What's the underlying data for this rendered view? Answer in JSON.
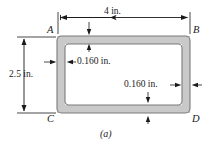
{
  "figure": {
    "caption": "(a)",
    "colors": {
      "wall_fill": "#c9c9c9",
      "wall_stroke": "#7a7a7a",
      "line": "#1a1a1a",
      "background": "#ffffff"
    },
    "corner_labels": {
      "top_left": "A",
      "top_right": "B",
      "bottom_left": "C",
      "bottom_right": "D"
    },
    "dimensions": {
      "width": "4 in.",
      "height": "2.5 in.",
      "wall_thickness_top": "0.160 in.",
      "wall_thickness_right": "0.160 in."
    }
  }
}
